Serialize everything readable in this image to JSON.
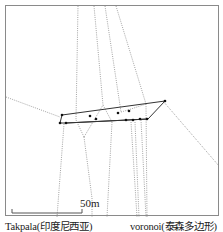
{
  "diagram": {
    "scale_bar": {
      "label": "50m"
    },
    "captions": {
      "left": "Takpala(印度尼西亚)",
      "right": "voronoi(泰森多边形)"
    },
    "colors": {
      "frame": "#8a8a8a",
      "hull": "#333333",
      "voronoi": "#8c8c8c",
      "points": "#111111"
    }
  }
}
